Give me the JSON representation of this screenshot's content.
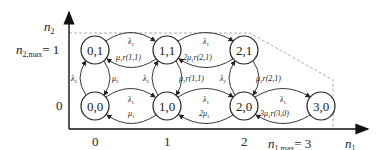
{
  "axes": {
    "x_label": "n",
    "x_sub": "1",
    "y_label": "n",
    "y_sub": "2",
    "x_ticks": [
      "0",
      "1",
      "2"
    ],
    "x_max_label": "n",
    "x_max_sub": "1,max",
    "x_max_value": "= 3",
    "y_ticks": [
      "0"
    ],
    "y_max_label": "n",
    "y_max_sub": "2,max",
    "y_max_value": "= 1"
  },
  "nodes": [
    {
      "id": "0,1",
      "label": "0,1"
    },
    {
      "id": "1,1",
      "label": "1,1"
    },
    {
      "id": "2,1",
      "label": "2,1"
    },
    {
      "id": "0,0",
      "label": "0,0"
    },
    {
      "id": "1,0",
      "label": "1,0"
    },
    {
      "id": "2,0",
      "label": "2,0"
    },
    {
      "id": "3,0",
      "label": "3,0"
    }
  ],
  "edges": {
    "h_01_11_fwd": "λ",
    "h_01_11_fwd_sub": "1",
    "h_01_11_back": "μ",
    "h_01_11_back_sub": "1",
    "h_01_11_back_tail": "r(1,1)",
    "h_11_21_fwd": "λ",
    "h_11_21_fwd_sub": "1",
    "h_11_21_back_pre": "2μ",
    "h_11_21_back_sub": "1",
    "h_11_21_back_tail": "r(2,1)",
    "h_00_10_fwd": "λ",
    "h_00_10_fwd_sub": "1",
    "h_00_10_back": "μ",
    "h_00_10_back_sub": "1",
    "h_10_20_fwd": "λ",
    "h_10_20_fwd_sub": "1",
    "h_10_20_back_pre": "2μ",
    "h_10_20_back_sub": "1",
    "h_20_30_fwd": "λ",
    "h_20_30_fwd_sub": "1",
    "h_20_30_back_pre": "3μ",
    "h_20_30_back_sub": "1",
    "h_20_30_back_tail": "r(3,0)",
    "v_0_up": "λ",
    "v_0_up_sub": "2",
    "v_0_down": "μ",
    "v_0_down_sub": "2",
    "v_1_up": "λ",
    "v_1_up_sub": "2",
    "v_1_down": "μ",
    "v_1_down_sub": "2",
    "v_1_down_tail": "r(1,1)",
    "v_2_up": "λ",
    "v_2_up_sub": "2",
    "v_2_down": "μ",
    "v_2_down_sub": "2",
    "v_2_down_tail": "r(2,1)"
  }
}
